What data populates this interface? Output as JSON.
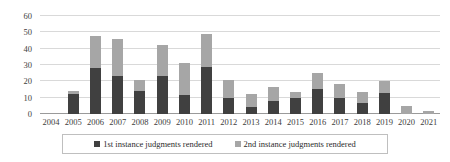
{
  "chart_data": {
    "type": "bar",
    "title": "",
    "subtitle": "",
    "xlabel": "",
    "ylabel": "",
    "stacked": true,
    "grid": true,
    "legend_position": "bottom",
    "ylim": [
      0,
      60
    ],
    "yticks": [
      0,
      10,
      20,
      30,
      40,
      50,
      60
    ],
    "ytick_labels": [
      "0",
      "10",
      "20",
      "30",
      "40",
      "50",
      "60"
    ],
    "categories": [
      "2004",
      "2005",
      "2006",
      "2007",
      "2008",
      "2009",
      "2010",
      "2011",
      "2012",
      "2013",
      "2014",
      "2015",
      "2016",
      "2017",
      "2018",
      "2019",
      "2020",
      "2021"
    ],
    "series": [
      {
        "name": "1st instance judgments rendered",
        "color": "#404040",
        "values": [
          0,
          12,
          28,
          23,
          14,
          23,
          11.5,
          29,
          9.5,
          4.5,
          8,
          9.5,
          15.5,
          9.5,
          6.5,
          13,
          0,
          0
        ]
      },
      {
        "name": "2nd instance judgments rendered",
        "color": "#a6a6a6",
        "values": [
          0,
          2,
          20,
          23,
          7,
          19,
          19.5,
          20,
          11.5,
          8,
          8.5,
          4,
          9.5,
          9,
          7,
          7.5,
          5,
          2
        ]
      }
    ],
    "totals": [
      0,
      14,
      48,
      46,
      21,
      42,
      31,
      49,
      21,
      12.5,
      16.5,
      13.5,
      25,
      18.5,
      13.5,
      20.5,
      5,
      2
    ]
  },
  "legend": {
    "items": [
      {
        "label": "1st instance judgments rendered",
        "swatch": "series-1-swatch"
      },
      {
        "label": "2nd instance judgments rendered",
        "swatch": "series-2-swatch"
      }
    ]
  },
  "colors": {
    "series_1": "#404040",
    "series_2": "#a6a6a6",
    "gridline": "#d9d9d9",
    "axis": "#9a9a9a",
    "text": "#3d3d3d",
    "background": "#ffffff"
  }
}
